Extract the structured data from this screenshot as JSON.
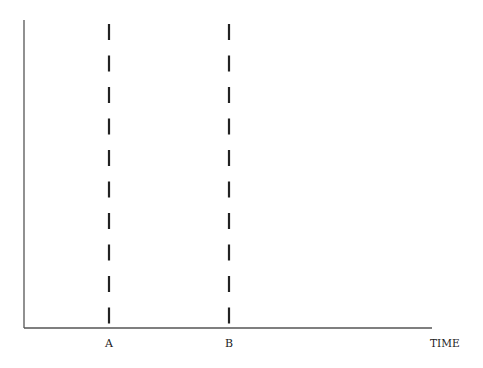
{
  "diagram": {
    "axes": {
      "x_label": "TIME",
      "y_label": "",
      "color": "#555555"
    },
    "markers": [
      {
        "label": "A",
        "x": 109
      },
      {
        "label": "B",
        "x": 229
      }
    ],
    "dash_color": "#222222"
  }
}
